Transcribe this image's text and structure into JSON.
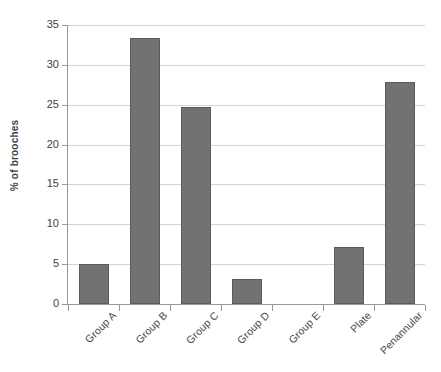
{
  "chart_data": {
    "type": "bar",
    "title": "",
    "xlabel": "",
    "ylabel": "% of brooches",
    "categories": [
      "Group A",
      "Group B",
      "Group C",
      "Group D",
      "Group E",
      "Plate",
      "Penannular"
    ],
    "values": [
      5.0,
      33.4,
      24.7,
      3.1,
      0,
      7.2,
      27.9
    ],
    "ylim": [
      0,
      35
    ],
    "yticks": [
      0,
      5,
      10,
      15,
      20,
      25,
      30,
      35
    ],
    "ytick_labels": [
      "0",
      "5",
      "10",
      "15",
      "20",
      "25",
      "30",
      "35"
    ],
    "grid": true,
    "legend": false,
    "series_name": "% of brooches",
    "colors": {
      "bar_fill": "#727272",
      "bar_border": "#5b5b5b",
      "gridline": "#d4d4d4",
      "axis": "#9a9a9a",
      "text": "#3f3f3f"
    }
  }
}
